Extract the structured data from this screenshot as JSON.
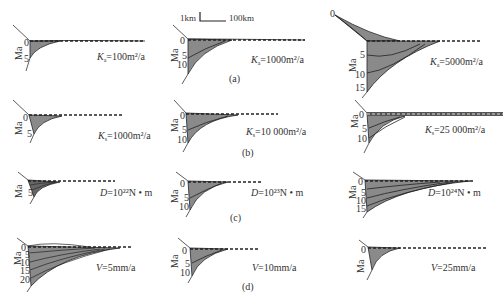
{
  "figure": {
    "scale_bar": {
      "vertical": "1km",
      "horizontal": "100km"
    },
    "axis_label": "Ma",
    "rows": [
      {
        "id": "a",
        "panel_label": "(a)",
        "plots": [
          {
            "param": "K",
            "sub": "a",
            "value": "=100m²/a",
            "ticks": [
              "0",
              "5"
            ]
          },
          {
            "param": "K",
            "sub": "a",
            "value": "=1000m²/a",
            "ticks": [
              "0",
              "5",
              "10"
            ]
          },
          {
            "param": "K",
            "sub": "a",
            "value": "=5000m²/a",
            "ticks": [
              "0",
              "5",
              "10",
              "15"
            ],
            "extra_tick": "0"
          }
        ]
      },
      {
        "id": "b",
        "panel_label": "(b)",
        "plots": [
          {
            "param": "K",
            "sub": "s",
            "value": "=1000m²/a",
            "ticks": [
              "0",
              "5"
            ]
          },
          {
            "param": "K",
            "sub": "s",
            "value": "=10 000m²/a",
            "ticks": [
              "0",
              "5",
              "10"
            ]
          },
          {
            "param": "K",
            "sub": "s",
            "value": "=25 000m²/a",
            "ticks": [
              "0",
              "5",
              "10"
            ]
          }
        ]
      },
      {
        "id": "c",
        "panel_label": "(c)",
        "plots": [
          {
            "param": "D",
            "sub": "",
            "value": "=10²²N • m",
            "ticks": [
              "0",
              "5"
            ]
          },
          {
            "param": "D",
            "sub": "",
            "value": "=10²³N • m",
            "ticks": [
              "0",
              "5",
              "10"
            ]
          },
          {
            "param": "D",
            "sub": "",
            "value": "=10²⁴N • m",
            "ticks": [
              "0",
              "5",
              "10",
              "15"
            ]
          }
        ]
      },
      {
        "id": "d",
        "panel_label": "(d)",
        "plots": [
          {
            "param": "V",
            "sub": "",
            "value": "=5mm/a",
            "ticks": [
              "0",
              "5",
              "10",
              "15",
              "20"
            ]
          },
          {
            "param": "V",
            "sub": "",
            "value": "=10mm/a",
            "ticks": [
              "0",
              "5",
              "10"
            ]
          },
          {
            "param": "V",
            "sub": "",
            "value": "=25mm/a",
            "ticks": [
              "0"
            ]
          }
        ]
      }
    ],
    "colors": {
      "fill": "#8a8a8a",
      "line": "#222222",
      "dash": "#222222"
    }
  }
}
